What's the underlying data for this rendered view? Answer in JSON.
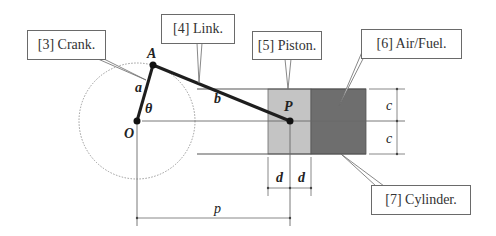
{
  "diagram": {
    "callouts": [
      {
        "id": "crank",
        "label": "[3] Crank."
      },
      {
        "id": "link",
        "label": "[4] Link."
      },
      {
        "id": "piston",
        "label": "[5] Piston."
      },
      {
        "id": "airfuel",
        "label": "[6] Air/Fuel."
      },
      {
        "id": "cylinder",
        "label": "[7] Cylinder."
      }
    ],
    "points": {
      "A": "A",
      "O": "O",
      "P": "P"
    },
    "symbols": {
      "a": "a",
      "b": "b",
      "theta": "θ",
      "c_top": "c",
      "c_bottom": "c",
      "d_left": "d",
      "d_right": "d",
      "p": "p"
    },
    "colors": {
      "piston": "#c4c4c4",
      "airfuel": "#6e6e6e",
      "link": "#1e1e1e",
      "lines": "#6a6a6a",
      "circle": "#9a9a9a"
    }
  }
}
